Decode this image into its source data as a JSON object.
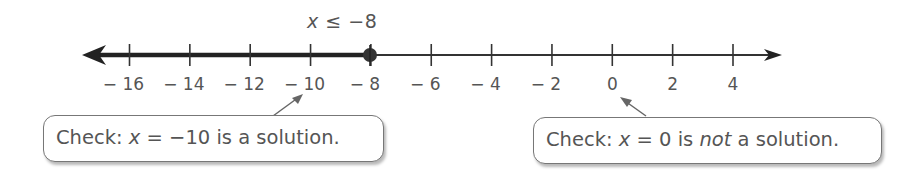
{
  "chart_data": {
    "type": "number_line",
    "title": "x ≤ −8",
    "inequality": {
      "variable": "x",
      "operator": "≤",
      "value": -8
    },
    "axis": {
      "min": -16,
      "max": 4,
      "tick_step": 2,
      "arrows": [
        "left",
        "right"
      ]
    },
    "tick_labels": [
      "−16",
      "−14",
      "−12",
      "−10",
      "−8",
      "−6",
      "−4",
      "−2",
      "0",
      "2",
      "4"
    ],
    "endpoint": {
      "value": -8,
      "style": "closed"
    },
    "shaded_direction": "left",
    "annotations": [
      {
        "text": "Check: x = −10 is a solution.",
        "points_to": -10
      },
      {
        "text": "Check: x = 0 is not a solution.",
        "points_to": 0
      }
    ]
  },
  "title": {
    "var": "x",
    "rest": " ≤ −8"
  },
  "ticks": [
    "−16",
    "−14",
    "−12",
    "−10",
    "−8",
    "−6",
    "−4",
    "−2",
    "0",
    "2",
    "4"
  ],
  "callouts": {
    "left": {
      "prefix": "Check: ",
      "var": "x",
      "middle": " = −10 is a solution.",
      "full": "Check: x = −10 is a solution."
    },
    "right": {
      "prefix": "Check: ",
      "var": "x",
      "middle": " = 0 is ",
      "emph": "not",
      "suffix": " a solution.",
      "full": "Check: x = 0 is not a solution."
    }
  },
  "colors": {
    "line": "#333333",
    "text": "#555555",
    "arrow": "#666666"
  }
}
